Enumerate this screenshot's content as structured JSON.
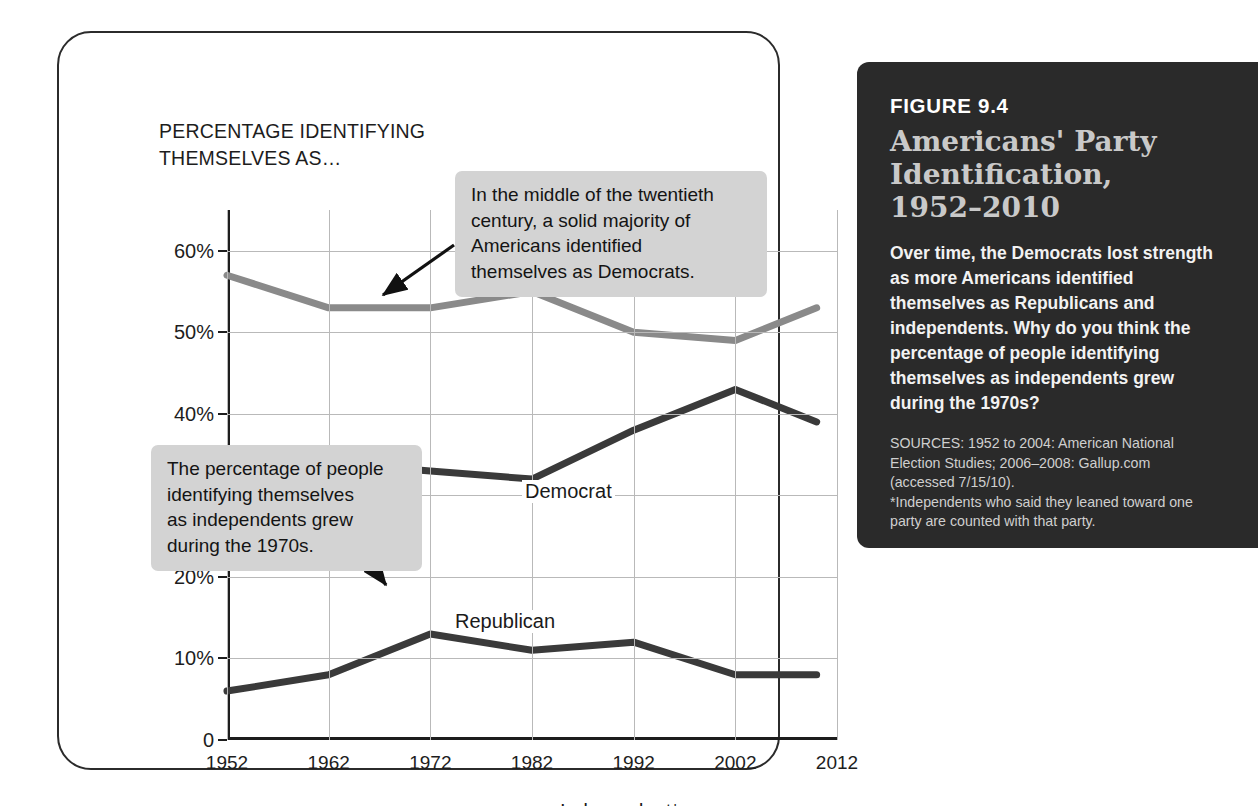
{
  "chart_card": {
    "heading": "PERCENTAGE IDENTIFYING\nTHEMSELVES AS…"
  },
  "annotations": [
    {
      "id": "democrat-callout",
      "text": "In the middle of the twentieth\ncentury, a solid majority of\nAmericans identified\nthemselves as Democrats."
    },
    {
      "id": "independent-callout",
      "text": "The percentage of people\nidentifying themselves\nas independents grew\nduring the 1970s."
    }
  ],
  "series_labels": {
    "democrat": "Democrat",
    "republican": "Republican",
    "independent": "Independent*"
  },
  "figure_panel": {
    "eyebrow": "FIGURE 9.4",
    "title": "Americans' Party\nIdentification,\n1952–2010",
    "description": "Over time, the Democrats lost strength as more Americans identified themselves as Republicans and independents. Why do you think the percentage of people identifying themselves as independents grew during the 1970s?",
    "sources": "SOURCES: 1952 to 2004: American National\nElection Studies; 2006–2008: Gallup.com\n(accessed 7/15/10).",
    "footnote": "*Independents who said they leaned toward one\nparty are counted with that party."
  },
  "colors": {
    "panel_background": "#2a2a2a",
    "panel_title": "#c9c9c9",
    "democrat_line": "#8a8a8a",
    "republican_line": "#3a3a3a",
    "independent_line": "#3a3a3a",
    "callout_background": "#d3d3d3",
    "gridline": "#b9b9b9",
    "axis": "#1d1d1d"
  },
  "chart_data": {
    "type": "line",
    "title": "Americans' Party Identification, 1952–2010",
    "subtitle": "PERCENTAGE IDENTIFYING THEMSELVES AS…",
    "xlabel": "",
    "ylabel": "",
    "x": [
      1952,
      1962,
      1972,
      1982,
      1992,
      2002,
      2010
    ],
    "xtick_labels": [
      "1952",
      "1962",
      "1972",
      "1982",
      "1992",
      "2002",
      "2012"
    ],
    "xtick_values": [
      1952,
      1962,
      1972,
      1982,
      1992,
      2002,
      2012
    ],
    "xlim": [
      1952,
      2012
    ],
    "ytick_labels": [
      "0",
      "10%",
      "20%",
      "30%",
      "40%",
      "50%",
      "60%"
    ],
    "ytick_values": [
      0,
      10,
      20,
      30,
      40,
      50,
      60
    ],
    "ylim": [
      0,
      65
    ],
    "grid": true,
    "legend": "inline-labels",
    "series": [
      {
        "name": "Democrat",
        "color": "#8a8a8a",
        "values": [
          57,
          53,
          53,
          55,
          50,
          49,
          53
        ]
      },
      {
        "name": "Republican",
        "color": "#3a3a3a",
        "values": [
          35,
          34,
          33,
          32,
          38,
          43,
          39
        ]
      },
      {
        "name": "Independent*",
        "color": "#3a3a3a",
        "values": [
          6,
          8,
          13,
          11,
          12,
          8,
          8
        ]
      }
    ],
    "annotations": [
      "In the middle of the twentieth century, a solid majority of Americans identified themselves as Democrats.",
      "The percentage of people identifying themselves as independents grew during the 1970s."
    ]
  }
}
